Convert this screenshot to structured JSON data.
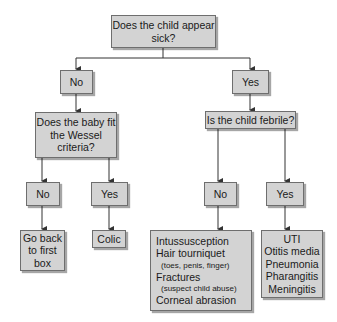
{
  "diagram": {
    "root": {
      "text": "Does the child appear sick?"
    },
    "level1": {
      "no": {
        "text": "No"
      },
      "yes": {
        "text": "Yes"
      }
    },
    "level2": {
      "wessel": {
        "line1": "Does the baby fit",
        "line2": "the Wessel",
        "line3": "criteria?"
      },
      "febrile": {
        "text": "Is the child febrile?"
      }
    },
    "level3": {
      "wessel_no": {
        "text": "No"
      },
      "wessel_yes": {
        "text": "Yes"
      },
      "febrile_no": {
        "text": "No"
      },
      "febrile_yes": {
        "text": "Yes"
      }
    },
    "outcomes": {
      "go_back": {
        "line1": "Go back",
        "line2": "to first",
        "line3": "box"
      },
      "colic": {
        "text": "Colic"
      },
      "afebrile_causes": [
        {
          "text": "Intussusception",
          "sub": false
        },
        {
          "text": "Hair tourniquet",
          "sub": false
        },
        {
          "text": "(toes, penis, finger)",
          "sub": true
        },
        {
          "text": "Fractures",
          "sub": false
        },
        {
          "text": "(suspect child abuse)",
          "sub": true
        },
        {
          "text": "Corneal abrasion",
          "sub": false
        }
      ],
      "febrile_causes": [
        {
          "text": "UTI"
        },
        {
          "text": "Otitis media"
        },
        {
          "text": "Pneumonia"
        },
        {
          "text": "Pharangitis"
        },
        {
          "text": "Meningitis"
        }
      ]
    },
    "colors": {
      "box_fill": "#d3d3d3",
      "box_border": "#6e6e6e",
      "line": "#333333",
      "background": "#ffffff"
    }
  }
}
